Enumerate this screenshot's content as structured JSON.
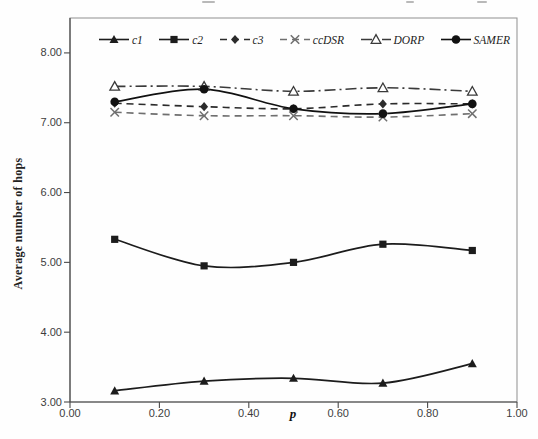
{
  "figure": {
    "background": "#fefefe",
    "border_color": "#8f8f8f",
    "axis_color": "#4a4a4a",
    "tick_text_color": "#3d3d3d"
  },
  "chart_data": {
    "type": "line",
    "title": "",
    "xlabel": "p",
    "ylabel": "Average number of hops",
    "xlim": [
      0.0,
      1.0
    ],
    "ylim": [
      3.0,
      8.5
    ],
    "grid": false,
    "legend_position": "top-inside-horizontal",
    "x_ticks": [
      {
        "v": 0.0,
        "label": "0.00"
      },
      {
        "v": 0.2,
        "label": "0.20"
      },
      {
        "v": 0.4,
        "label": "0.40"
      },
      {
        "v": 0.6,
        "label": "0.60"
      },
      {
        "v": 0.8,
        "label": "0.80"
      },
      {
        "v": 1.0,
        "label": "1.00"
      }
    ],
    "y_ticks": [
      {
        "v": 3.0,
        "label": "3.00"
      },
      {
        "v": 4.0,
        "label": "4.00"
      },
      {
        "v": 5.0,
        "label": "5.00"
      },
      {
        "v": 6.0,
        "label": "6.00"
      },
      {
        "v": 7.0,
        "label": "7.00"
      },
      {
        "v": 8.0,
        "label": "8.00"
      }
    ],
    "x": [
      0.1,
      0.3,
      0.5,
      0.7,
      0.9
    ],
    "series": [
      {
        "name": "c1",
        "values": [
          3.16,
          3.3,
          3.34,
          3.27,
          3.55
        ],
        "line": "solid",
        "marker": "triangle-filled",
        "color": "#1c1c1c"
      },
      {
        "name": "c2",
        "values": [
          5.33,
          4.95,
          5.0,
          5.26,
          5.17
        ],
        "line": "solid",
        "marker": "square-filled",
        "color": "#1c1c1c"
      },
      {
        "name": "c3",
        "values": [
          7.28,
          7.23,
          7.2,
          7.27,
          7.27
        ],
        "line": "dashed",
        "marker": "diamond-filled",
        "color": "#2b2b2b"
      },
      {
        "name": "ccDSR",
        "values": [
          7.15,
          7.1,
          7.1,
          7.08,
          7.13
        ],
        "line": "dashed",
        "marker": "x",
        "color": "#6f6f6f"
      },
      {
        "name": "DORP",
        "values": [
          7.52,
          7.52,
          7.45,
          7.5,
          7.45
        ],
        "line": "dashdot",
        "marker": "triangle-open",
        "color": "#3a3a3a"
      },
      {
        "name": "SAMER",
        "values": [
          7.3,
          7.48,
          7.2,
          7.13,
          7.27
        ],
        "line": "solid",
        "marker": "circle-filled",
        "color": "#111111"
      }
    ]
  }
}
